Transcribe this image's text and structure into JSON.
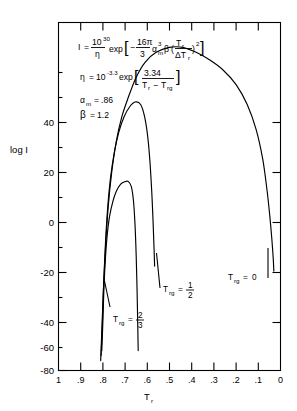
{
  "chart_data": {
    "type": "line",
    "title": "",
    "xlabel": "T_r",
    "ylabel": "log I",
    "xlim": [
      1.0,
      0.0
    ],
    "ylim": [
      -80,
      60
    ],
    "grid": false,
    "legend": "inline-annotations",
    "x_ticks": [
      "1",
      ".9",
      ".8",
      ".7",
      ".6",
      ".5",
      ".4",
      ".3",
      ".2",
      ".1",
      "0"
    ],
    "x_tick_values": [
      1.0,
      0.9,
      0.8,
      0.7,
      0.6,
      0.5,
      0.4,
      0.3,
      0.2,
      0.1,
      0.0
    ],
    "y_ticks": [
      "40",
      "20",
      "0",
      "-20",
      "-40",
      "-60",
      "-80"
    ],
    "y_tick_values": [
      40,
      20,
      0,
      -20,
      -40,
      -60,
      -80
    ],
    "series": [
      {
        "name": "Trg = 2/3",
        "label": "T_rg = 2/3",
        "points": [
          [
            0.805,
            -72
          ],
          [
            0.8,
            -60
          ],
          [
            0.795,
            -46
          ],
          [
            0.788,
            -34
          ],
          [
            0.78,
            -25
          ],
          [
            0.77,
            -18
          ],
          [
            0.755,
            -12
          ],
          [
            0.74,
            -8
          ],
          [
            0.72,
            -5
          ],
          [
            0.7,
            -4
          ],
          [
            0.685,
            -4
          ],
          [
            0.672,
            -6
          ],
          [
            0.662,
            -12
          ],
          [
            0.655,
            -22
          ],
          [
            0.65,
            -34
          ],
          [
            0.646,
            -48
          ],
          [
            0.643,
            -62
          ],
          [
            0.641,
            -72
          ]
        ]
      },
      {
        "name": "Trg = 1/2",
        "label": "T_rg = 1/2",
        "points": [
          [
            0.808,
            -74
          ],
          [
            0.802,
            -60
          ],
          [
            0.796,
            -44
          ],
          [
            0.788,
            -28
          ],
          [
            0.778,
            -14
          ],
          [
            0.765,
            -2
          ],
          [
            0.748,
            8
          ],
          [
            0.728,
            16
          ],
          [
            0.705,
            22
          ],
          [
            0.68,
            26
          ],
          [
            0.655,
            28
          ],
          [
            0.63,
            27
          ],
          [
            0.612,
            22
          ],
          [
            0.598,
            14
          ],
          [
            0.588,
            4
          ],
          [
            0.58,
            -8
          ],
          [
            0.574,
            -20
          ],
          [
            0.57,
            -30
          ],
          [
            0.567,
            -38
          ]
        ]
      },
      {
        "name": "Trg = 0",
        "label": "T_rg = 0",
        "points": [
          [
            0.81,
            -76
          ],
          [
            0.804,
            -62
          ],
          [
            0.797,
            -46
          ],
          [
            0.788,
            -30
          ],
          [
            0.776,
            -14
          ],
          [
            0.76,
            0
          ],
          [
            0.74,
            12
          ],
          [
            0.715,
            22
          ],
          [
            0.685,
            30
          ],
          [
            0.65,
            38
          ],
          [
            0.61,
            44
          ],
          [
            0.56,
            48
          ],
          [
            0.5,
            50
          ],
          [
            0.44,
            50
          ],
          [
            0.38,
            48
          ],
          [
            0.32,
            45
          ],
          [
            0.26,
            41
          ],
          [
            0.2,
            35
          ],
          [
            0.15,
            27
          ],
          [
            0.11,
            17
          ],
          [
            0.08,
            5
          ],
          [
            0.06,
            -8
          ],
          [
            0.048,
            -18
          ],
          [
            0.04,
            -26
          ],
          [
            0.035,
            -32
          ],
          [
            0.032,
            -36
          ],
          [
            0.03,
            -40
          ]
        ]
      }
    ],
    "annotations": {
      "equation_1": {
        "lhs": "I",
        "eq": "=",
        "prefactor_num": "10",
        "prefactor_num_exp": "30",
        "prefactor_den": "η",
        "exp_text": "exp",
        "bracket_open": "[",
        "minus": "−",
        "frac2_num": "16π",
        "frac2_den": "3",
        "alpha": "α",
        "alpha_sub": "m",
        "alpha_sup": "3",
        "beta": "β",
        "paren_open": "(",
        "inner_num": "T",
        "inner_num_sub": "r",
        "inner_den": "ΔT",
        "inner_den_sub": "r",
        "paren_close": ")",
        "paren_exp": "2",
        "bracket_close": "]"
      },
      "equation_2": {
        "lhs": "η",
        "eq": "=",
        "base": "10",
        "base_exp": "-3.3",
        "exp_text": "exp",
        "bracket_open": "[",
        "frac_num": "3.34",
        "frac_den_a": "T",
        "frac_den_a_sub": "r",
        "frac_den_minus": "−",
        "frac_den_b": "T",
        "frac_den_b_sub": "rg",
        "bracket_close": "]"
      },
      "param_1": {
        "symbol": "α",
        "symbol_sub": "m",
        "eq": "=",
        "value": ".86"
      },
      "param_2": {
        "symbol": "β",
        "eq": "=",
        "value": "1.2"
      },
      "curve_label_1": {
        "symbol": "T",
        "symbol_sub": "rg",
        "eq": "=",
        "num": "2",
        "den": "3"
      },
      "curve_label_2": {
        "symbol": "T",
        "symbol_sub": "rg",
        "eq": "=",
        "num": "1",
        "den": "2"
      },
      "curve_label_3": {
        "symbol": "T",
        "symbol_sub": "rg",
        "eq": "=",
        "value": "0"
      }
    },
    "axis_labels": {
      "y_title": "log I",
      "x_title_main": "T",
      "x_title_sub": "r"
    }
  }
}
